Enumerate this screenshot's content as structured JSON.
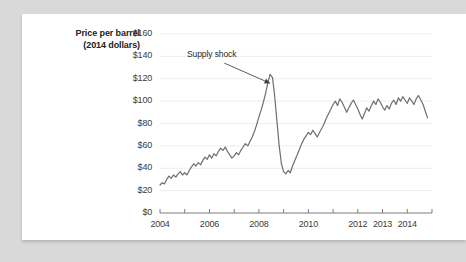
{
  "chart_data": {
    "type": "line",
    "title": "",
    "ylabel": "Price per barrel (2014 dollars)",
    "ylabel_line1": "Price per barrel",
    "ylabel_line2": "(2014 dollars)",
    "xlabel": "",
    "ylim": [
      0,
      160
    ],
    "xlim": [
      2004,
      2015
    ],
    "grid": true,
    "legend": "none",
    "y_ticks": [
      0,
      20,
      40,
      60,
      80,
      100,
      120,
      140,
      160
    ],
    "y_tick_labels": [
      "$0",
      "$20",
      "$40",
      "$60",
      "$80",
      "$100",
      "$120",
      "$140",
      "$160"
    ],
    "x_ticks": [
      2004,
      2005,
      2006,
      2007,
      2008,
      2009,
      2010,
      2011,
      2012,
      2013,
      2014,
      2015
    ],
    "x_tick_labels": [
      "2004",
      "",
      "2006",
      "",
      "2008",
      "",
      "2010",
      "",
      "2012",
      "2013",
      "2014",
      ""
    ],
    "x_visible_labels": [
      {
        "year": 2004,
        "label": "2004"
      },
      {
        "year": 2006,
        "label": "2006"
      },
      {
        "year": 2008,
        "label": "2008"
      },
      {
        "year": 2010,
        "label": "2010"
      },
      {
        "year": 2012,
        "label": "2012"
      },
      {
        "year": 2013,
        "label": "2013"
      },
      {
        "year": 2014,
        "label": "2014"
      }
    ],
    "annotations": [
      {
        "text": "Supply shock",
        "label_x": 2006.55,
        "label_y": 141,
        "arrow_from_x": 2006.6,
        "arrow_from_y": 134,
        "arrow_to_x": 2008.45,
        "arrow_to_y": 116
      }
    ],
    "series": [
      {
        "name": "Price per barrel (2014 dollars)",
        "color": "#6e6e6e",
        "x": [
          2004.0,
          2004.09,
          2004.18,
          2004.27,
          2004.36,
          2004.45,
          2004.55,
          2004.64,
          2004.73,
          2004.82,
          2004.91,
          2005.0,
          2005.09,
          2005.18,
          2005.27,
          2005.36,
          2005.45,
          2005.55,
          2005.64,
          2005.73,
          2005.82,
          2005.91,
          2006.0,
          2006.09,
          2006.18,
          2006.27,
          2006.36,
          2006.45,
          2006.55,
          2006.64,
          2006.73,
          2006.82,
          2006.91,
          2007.0,
          2007.09,
          2007.18,
          2007.27,
          2007.36,
          2007.45,
          2007.55,
          2007.64,
          2007.73,
          2007.82,
          2007.91,
          2008.0,
          2008.09,
          2008.18,
          2008.27,
          2008.36,
          2008.45,
          2008.55,
          2008.64,
          2008.73,
          2008.82,
          2008.91,
          2009.0,
          2009.09,
          2009.18,
          2009.27,
          2009.36,
          2009.45,
          2009.55,
          2009.64,
          2009.73,
          2009.82,
          2009.91,
          2010.0,
          2010.09,
          2010.18,
          2010.27,
          2010.36,
          2010.45,
          2010.55,
          2010.64,
          2010.73,
          2010.82,
          2010.91,
          2011.0,
          2011.09,
          2011.18,
          2011.27,
          2011.36,
          2011.45,
          2011.55,
          2011.64,
          2011.73,
          2011.82,
          2011.91,
          2012.0,
          2012.09,
          2012.18,
          2012.27,
          2012.36,
          2012.45,
          2012.55,
          2012.64,
          2012.73,
          2012.82,
          2012.91,
          2013.0,
          2013.09,
          2013.18,
          2013.27,
          2013.36,
          2013.45,
          2013.55,
          2013.64,
          2013.73,
          2013.82,
          2013.91,
          2014.0,
          2014.09,
          2014.18,
          2014.27,
          2014.36,
          2014.45,
          2014.55,
          2014.64,
          2014.73,
          2014.82
        ],
        "y": [
          25,
          27,
          26,
          30,
          33,
          31,
          34,
          32,
          35,
          37,
          34,
          36,
          34,
          38,
          41,
          44,
          42,
          45,
          43,
          47,
          50,
          48,
          52,
          49,
          53,
          51,
          55,
          58,
          56,
          59,
          55,
          52,
          49,
          51,
          54,
          52,
          56,
          59,
          62,
          60,
          64,
          68,
          73,
          79,
          86,
          92,
          99,
          107,
          116,
          124,
          121,
          104,
          82,
          60,
          44,
          37,
          35,
          38,
          36,
          42,
          47,
          52,
          57,
          62,
          66,
          69,
          72,
          70,
          74,
          71,
          68,
          72,
          76,
          80,
          85,
          89,
          93,
          97,
          100,
          96,
          102,
          99,
          95,
          90,
          94,
          98,
          101,
          97,
          93,
          88,
          84,
          89,
          94,
          91,
          96,
          100,
          97,
          102,
          99,
          95,
          92,
          96,
          93,
          98,
          101,
          97,
          103,
          100,
          104,
          101,
          98,
          103,
          100,
          97,
          102,
          105,
          101,
          97,
          91,
          85
        ]
      }
    ]
  }
}
